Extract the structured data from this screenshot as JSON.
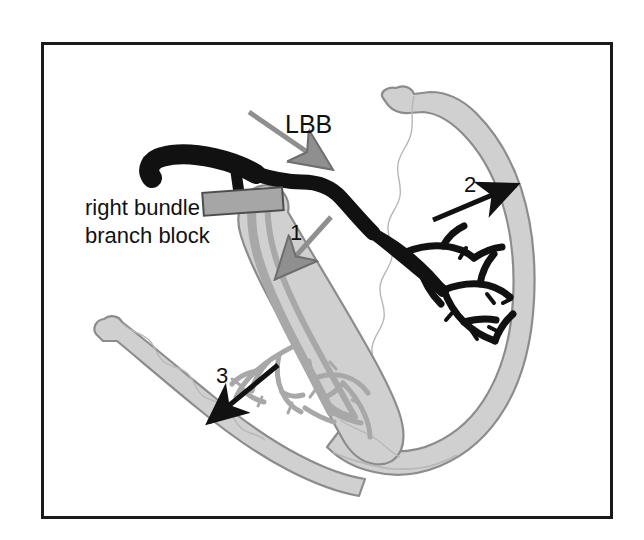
{
  "figure": {
    "frame": {
      "border_color": "#1a1a1a",
      "background_color": "#ffffff"
    }
  },
  "colors": {
    "myocardium_fill": "#d0d0d0",
    "myocardium_stroke": "#8c8c8c",
    "left_bundle_black": "#111111",
    "right_bundle_gray": "#a8a8a8",
    "right_bundle_stroke": "#8a8a8a",
    "block_bar_fill": "#a6a6a6",
    "block_bar_stroke": "#4d4d4d",
    "arrow_black": "#111111",
    "arrow_gray": "#8f8f8f",
    "text_color": "#111111"
  },
  "labels": {
    "lbb": "LBB",
    "rbbb_line1": "right bundle",
    "rbbb_line2": "branch block",
    "arrow_1": "1",
    "arrow_2": "2",
    "arrow_3": "3"
  },
  "annotations": [
    {
      "id": "lbb-arrow",
      "label": "LBB",
      "color": "#8f8f8f",
      "direction": "down-right",
      "points_to": "left-bundle-branch"
    },
    {
      "id": "arrow-1",
      "label": "1",
      "color": "#8f8f8f",
      "direction": "down-left",
      "points_to": "interventricular-septum"
    },
    {
      "id": "arrow-2",
      "label": "2",
      "color": "#111111",
      "direction": "up-right",
      "points_to": "left-ventricle-free-wall"
    },
    {
      "id": "arrow-3",
      "label": "3",
      "color": "#111111",
      "direction": "down-left",
      "points_to": "right-ventricle-free-wall"
    }
  ],
  "structures": [
    {
      "id": "left-ventricle-wall",
      "name": "left ventricular free wall",
      "fill": "#d0d0d0"
    },
    {
      "id": "right-ventricle-wall",
      "name": "right ventricular free wall",
      "fill": "#d0d0d0"
    },
    {
      "id": "interventricular-septum",
      "name": "interventricular septum",
      "fill": "#d0d0d0"
    },
    {
      "id": "bundle-of-his",
      "name": "bundle of His",
      "fill": "#111111"
    },
    {
      "id": "left-bundle-branch",
      "name": "left bundle branch and Purkinje network",
      "fill": "#111111"
    },
    {
      "id": "right-bundle-branch",
      "name": "right bundle branch and Purkinje network",
      "fill": "#a8a8a8"
    },
    {
      "id": "block-bar",
      "name": "conduction block bar",
      "fill": "#a6a6a6"
    }
  ]
}
